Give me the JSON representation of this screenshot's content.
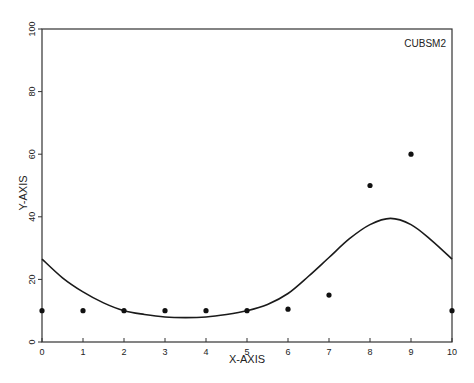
{
  "chart_data": {
    "type": "scatter",
    "title": "",
    "annotation": "CUBSM2",
    "xlabel": "X-AXIS",
    "ylabel": "Y-AXIS",
    "xlim": [
      0,
      10
    ],
    "ylim": [
      0,
      100
    ],
    "xticks": [
      0,
      1,
      2,
      3,
      4,
      5,
      6,
      7,
      8,
      9,
      10
    ],
    "yticks": [
      0,
      20,
      40,
      60,
      80,
      100
    ],
    "grid": false,
    "legend": null,
    "series": [
      {
        "name": "data points",
        "kind": "scatter",
        "x": [
          0,
          1,
          2,
          3,
          4,
          5,
          6,
          7,
          8,
          9,
          10
        ],
        "y": [
          10,
          10,
          10,
          10,
          10,
          10,
          10.5,
          15,
          50,
          60,
          10
        ]
      },
      {
        "name": "cubic smoothing curve",
        "kind": "line",
        "x": [
          0,
          0.5,
          1,
          1.5,
          2,
          2.5,
          3,
          3.5,
          4,
          4.5,
          5,
          5.5,
          6,
          6.5,
          7,
          7.5,
          8,
          8.5,
          9,
          9.5,
          10
        ],
        "y": [
          26.5,
          20.5,
          16,
          12.5,
          10,
          8.8,
          8,
          7.8,
          8,
          8.8,
          10,
          12,
          15.5,
          21,
          27,
          33,
          37.5,
          39.5,
          37.5,
          32.5,
          26.5
        ]
      }
    ]
  }
}
